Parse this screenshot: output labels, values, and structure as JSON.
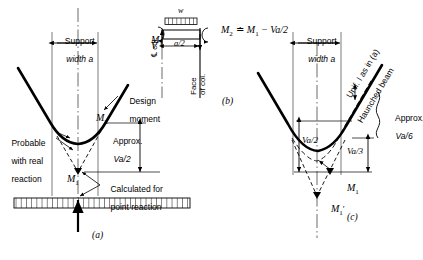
{
  "figure": {
    "title_implied": "Bending moment at support: point reaction vs real reaction",
    "panels": [
      {
        "key": "a",
        "caption": "(a)"
      },
      {
        "key": "b",
        "caption": "(b)"
      },
      {
        "key": "c",
        "caption": "(c)"
      }
    ]
  },
  "panel_a": {
    "support_width_line1": "Support",
    "support_width_line2": "width a",
    "m2_label": "M",
    "m2_sub": "2",
    "m1_label": "M",
    "m1_sub": "1",
    "design_moment_line1": "Design",
    "design_moment_line2": "moment",
    "approx_line1": "Approx.",
    "approx_line2": "Va/2",
    "probable_line1": "Probable",
    "probable_line2": "with real",
    "probable_line3": "reaction",
    "calculated_line1": "Calculated for",
    "calculated_line2": "point reaction",
    "caption": "(a)"
  },
  "panel_b": {
    "load_label": "w",
    "m1_label": "M",
    "m1_sub": "1",
    "shear_label": "V",
    "dim_label": "a/2",
    "cl_col_label": "℄ col.",
    "face_col_line1": "Face",
    "face_col_line2": "of col.",
    "equation": "M₂ ≐ M₁ − Va/2",
    "equation_parts": {
      "lhs": "M",
      "lhs_sub": "2",
      "approx_equals": "≐",
      "rhs_first": "M",
      "rhs_first_sub": "1",
      "minus": "−",
      "rhs_term": "Va/2"
    },
    "caption": "(b)"
  },
  "panel_c": {
    "support_width_line1": "Support",
    "support_width_line2": "width a",
    "va2_label": "Va/2",
    "va3_label": "Va/3",
    "approx_line1": "Approx.",
    "approx_line2": "Va/6",
    "unif_label": "Unif. I as in (a)",
    "haunched_label": "Haunched beam",
    "m1_label": "M",
    "m1_sub": "1",
    "m1prime_label": "M",
    "m1prime_sub": "1",
    "m1prime_mark": "′",
    "caption": "(c)"
  },
  "colors": {
    "ink": "#000000",
    "background": "#ffffff",
    "thin_line": "#333333",
    "construction_line": "#555555"
  }
}
